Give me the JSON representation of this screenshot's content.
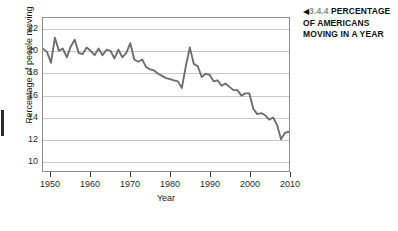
{
  "caption": {
    "arrow_icon": "left-triangle-icon",
    "arrow_glyph": "◀",
    "number": "3.4.4",
    "lines": [
      "PERCENTAGE",
      "OF AMERICANS",
      "MOVING IN A YEAR"
    ],
    "line1_rest": " PERCENTAGE",
    "line2": "OF AMERICANS",
    "line3": "MOVING IN A YEAR"
  },
  "chart_data": {
    "type": "line",
    "title": "",
    "xlabel": "Year",
    "ylabel": "Percentage of people moving",
    "xlim": [
      1948,
      2010
    ],
    "ylim": [
      9,
      23
    ],
    "xticks": [
      1950,
      1960,
      1970,
      1980,
      1990,
      2000,
      2010
    ],
    "yticks": [
      10,
      12,
      14,
      16,
      18,
      20,
      22
    ],
    "grid": "horizontal",
    "legend": "none",
    "line_color": "#6e6e6e",
    "grid_color": "#c9c9c9",
    "axis_color": "#8e8e8e",
    "x": [
      1948,
      1949,
      1950,
      1951,
      1952,
      1953,
      1954,
      1955,
      1956,
      1957,
      1958,
      1959,
      1960,
      1961,
      1962,
      1963,
      1964,
      1965,
      1966,
      1967,
      1968,
      1969,
      1970,
      1971,
      1972,
      1973,
      1974,
      1975,
      1976,
      1977,
      1978,
      1979,
      1980,
      1981,
      1982,
      1983,
      1984,
      1985,
      1986,
      1987,
      1988,
      1989,
      1990,
      1991,
      1992,
      1993,
      1994,
      1995,
      1996,
      1997,
      1998,
      1999,
      2000,
      2001,
      2002,
      2003,
      2004,
      2005,
      2006,
      2007,
      2008,
      2009,
      2010
    ],
    "values": [
      20.2,
      19.9,
      18.9,
      21.2,
      20.0,
      20.2,
      19.4,
      20.4,
      21.0,
      19.8,
      19.7,
      20.3,
      20.0,
      19.6,
      20.2,
      19.6,
      20.1,
      20.0,
      19.3,
      20.1,
      19.4,
      19.8,
      20.7,
      19.2,
      19.0,
      19.2,
      18.5,
      18.3,
      18.2,
      17.9,
      17.7,
      17.5,
      17.4,
      17.3,
      17.2,
      16.6,
      18.6,
      20.3,
      18.8,
      18.6,
      17.6,
      17.9,
      17.8,
      17.2,
      17.3,
      16.8,
      17.0,
      16.7,
      16.4,
      16.4,
      15.9,
      16.1,
      16.1,
      14.7,
      14.2,
      14.3,
      14.1,
      13.7,
      13.9,
      13.2,
      11.9,
      12.5,
      12.6
    ]
  }
}
